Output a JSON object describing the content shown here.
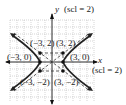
{
  "axes": {
    "x_label": "x",
    "y_label": "y",
    "x_scale_label": "(scl = 2)",
    "y_scale_label": "(scl = 2)"
  },
  "points": [
    {
      "label": "(−3, 2)"
    },
    {
      "label": "(3, 2)"
    },
    {
      "label": "(−3, 0)"
    },
    {
      "label": "(3, 0)"
    },
    {
      "label": "(−3, −2)"
    },
    {
      "label": "(3, −2)"
    }
  ],
  "colors": {
    "curve": "#222222",
    "grid": "#9a9a9a",
    "axis": "#111111"
  }
}
